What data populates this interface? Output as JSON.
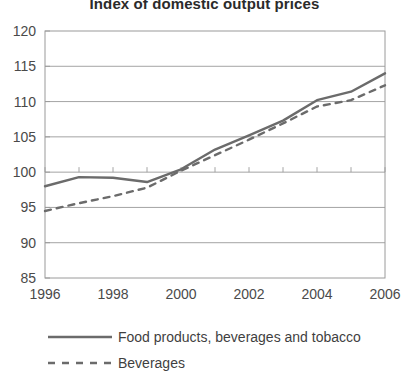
{
  "chart_data": {
    "type": "line",
    "title": "Index of domestic output prices",
    "xlabel": "",
    "ylabel": "",
    "x": [
      1996,
      1997,
      1998,
      1999,
      2000,
      2001,
      2002,
      2003,
      2004,
      2005,
      2006
    ],
    "xlim": [
      1996,
      2006
    ],
    "ylim": [
      85,
      120
    ],
    "yticks": [
      85,
      90,
      95,
      100,
      105,
      110,
      115,
      120
    ],
    "xticks": [
      1996,
      1998,
      2000,
      2002,
      2004,
      2006
    ],
    "xtick_labels": [
      "1996",
      "1998",
      "2000",
      "2002",
      "2004",
      "2006"
    ],
    "ytick_labels": [
      "120",
      "115",
      "110",
      "105",
      "100",
      "95",
      "90",
      "85"
    ],
    "grid": "horizontal",
    "legend_position": "bottom-left",
    "line_color": "#6b6b6b",
    "series": [
      {
        "name": "Food products, beverages and tobacco",
        "style": "solid",
        "color": "#6b6b6b",
        "values": [
          98.0,
          99.3,
          99.2,
          98.6,
          100.4,
          103.2,
          105.2,
          107.3,
          110.2,
          111.4,
          114.0
        ]
      },
      {
        "name": "Beverages",
        "style": "dashed",
        "color": "#6b6b6b",
        "values": [
          94.5,
          95.6,
          96.6,
          97.8,
          100.2,
          102.4,
          104.6,
          106.9,
          109.3,
          110.2,
          112.3
        ]
      }
    ]
  },
  "legend": {
    "items": [
      {
        "label": "Food products, beverages and tobacco",
        "style": "solid"
      },
      {
        "label": "Beverages",
        "style": "dashed"
      }
    ]
  }
}
